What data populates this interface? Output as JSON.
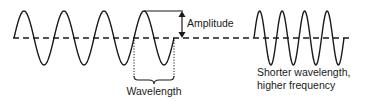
{
  "labels": {
    "amplitude": "Amplitude",
    "wavelength": "Wavelength",
    "shorter_line1": "Shorter wavelength,",
    "shorter_line2": "higher frequency"
  },
  "waves": {
    "long": {
      "cycles": 4,
      "start_x": 14,
      "wavelength_px": 40,
      "midline_y": 38,
      "amplitude_px": 27
    },
    "short": {
      "cycles": 4,
      "start_x": 254,
      "wavelength_px": 22.5,
      "midline_y": 38,
      "amplitude_px": 27
    }
  },
  "midline": {
    "x1": 13,
    "x2": 350,
    "y": 38,
    "style": "dashed"
  },
  "colors": {
    "stroke": "#1a1a1a",
    "background": "#ffffff"
  }
}
